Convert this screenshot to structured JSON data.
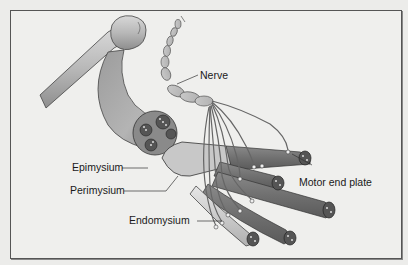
{
  "figure": {
    "labels": {
      "nerve": "Nerve",
      "epimysium": "Epimysium",
      "perimysium": "Perimysium",
      "endomysium": "Endomysium",
      "motor_end_plate": "Motor end plate"
    },
    "parts": [
      "bone",
      "tendon",
      "muscle",
      "muscle fascicles",
      "muscle fibers",
      "nerve",
      "nerve branches",
      "motor end plates"
    ]
  }
}
